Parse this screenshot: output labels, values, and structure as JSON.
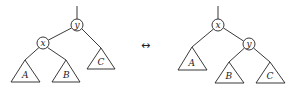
{
  "diagram": {
    "type": "tree-rotation",
    "arrow": "↔",
    "left_tree": {
      "root": "y",
      "nodes": [
        {
          "id": "y",
          "label": "y",
          "cx": 77,
          "cy": 25
        },
        {
          "id": "x",
          "label": "x",
          "cx": 43,
          "cy": 43
        }
      ],
      "subtrees": [
        {
          "id": "A",
          "label": "A",
          "apex": [
            25,
            60
          ],
          "base": [
            11,
            40,
            82
          ]
        },
        {
          "id": "B",
          "label": "B",
          "apex": [
            66,
            60
          ],
          "base": [
            52,
            80,
            82
          ]
        },
        {
          "id": "C",
          "label": "C",
          "apex": [
            101,
            48
          ],
          "base": [
            87,
            115,
            69
          ]
        }
      ]
    },
    "right_tree": {
      "root": "x",
      "nodes": [
        {
          "id": "x",
          "label": "x",
          "cx": 218,
          "cy": 25
        },
        {
          "id": "y",
          "label": "y",
          "cx": 249,
          "cy": 44
        }
      ],
      "subtrees": [
        {
          "id": "A",
          "label": "A",
          "apex": [
            192,
            47
          ],
          "base": [
            178,
            207,
            70
          ]
        },
        {
          "id": "B",
          "label": "B",
          "apex": [
            229,
            62
          ],
          "base": [
            215,
            244,
            83
          ]
        },
        {
          "id": "C",
          "label": "C",
          "apex": [
            270,
            62
          ],
          "base": [
            256,
            285,
            83
          ]
        }
      ]
    }
  }
}
